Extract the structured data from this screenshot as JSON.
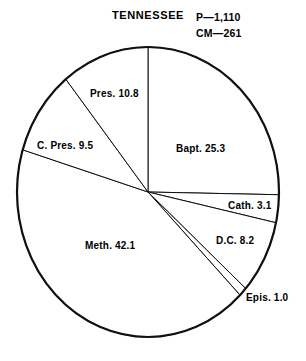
{
  "figure": {
    "title": "TENNESSEE",
    "notes": [
      {
        "id": "population",
        "text": "P—1,110"
      },
      {
        "id": "church-members",
        "text": "CM—261"
      }
    ]
  },
  "chart_data": {
    "type": "pie",
    "title": "TENNESSEE",
    "xlabel": "",
    "ylabel": "",
    "units": "percent",
    "total": 100.0,
    "start_angle_deg": 0,
    "direction": "clockwise",
    "legend": "none",
    "grid": false,
    "annotations": [
      "P—1,110",
      "CM—261"
    ],
    "categories": [
      "Bapt.",
      "Cath.",
      "D.C.",
      "Epis.",
      "Meth.",
      "C. Pres.",
      "Pres."
    ],
    "values": [
      25.3,
      3.1,
      8.2,
      1.0,
      42.1,
      9.5,
      10.8
    ],
    "slices": [
      {
        "label": "Bapt. 25.3",
        "name": "Bapt.",
        "value": 25.3,
        "color": "#ffffff"
      },
      {
        "label": "Cath. 3.1",
        "name": "Cath.",
        "value": 3.1,
        "color": "#ffffff"
      },
      {
        "label": "D.C. 8.2",
        "name": "D.C.",
        "value": 8.2,
        "color": "#ffffff"
      },
      {
        "label": "Epis. 1.0",
        "name": "Epis.",
        "value": 1.0,
        "color": "#ffffff"
      },
      {
        "label": "Meth. 42.1",
        "name": "Meth.",
        "value": 42.1,
        "color": "#ffffff"
      },
      {
        "label": "C. Pres. 9.5",
        "name": "C. Pres.",
        "value": 9.5,
        "color": "#ffffff"
      },
      {
        "label": "Pres. 10.8",
        "name": "Pres.",
        "value": 10.8,
        "color": "#ffffff"
      }
    ],
    "stroke_color": "#111111",
    "background_color": "#ffffff"
  }
}
